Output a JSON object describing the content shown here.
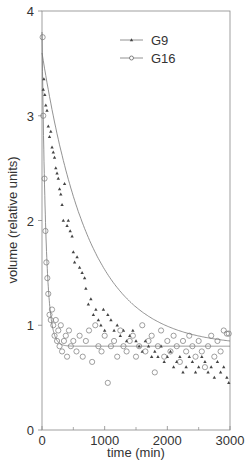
{
  "chart_data": {
    "type": "scatter",
    "title": "",
    "xlabel": "time (min)",
    "ylabel": "volume (relative units)",
    "xlim": [
      0,
      3000
    ],
    "ylim": [
      0,
      4
    ],
    "x_ticks": [
      0,
      1000,
      2000,
      3000
    ],
    "x_minor_ticks": [
      500,
      1500,
      2500
    ],
    "y_ticks": [
      0,
      1,
      2,
      3,
      4
    ],
    "grid": false,
    "legend_position": "upper right",
    "series": [
      {
        "name": "G9",
        "marker": "filled-triangle",
        "fit": {
          "model": "exponential_decay",
          "plateau": 0.8,
          "amplitude": 2.8,
          "tau_min": 745
        },
        "points": [
          [
            20,
            3.25
          ],
          [
            30,
            3.35
          ],
          [
            45,
            3.2
          ],
          [
            60,
            3.1
          ],
          [
            80,
            3.05
          ],
          [
            100,
            2.9
          ],
          [
            120,
            2.8
          ],
          [
            140,
            2.85
          ],
          [
            160,
            2.7
          ],
          [
            180,
            2.65
          ],
          [
            200,
            2.6
          ],
          [
            220,
            2.5
          ],
          [
            240,
            2.45
          ],
          [
            260,
            2.4
          ],
          [
            280,
            2.3
          ],
          [
            300,
            2.25
          ],
          [
            320,
            2.15
          ],
          [
            340,
            2.0
          ],
          [
            360,
            2.35
          ],
          [
            400,
            1.95
          ],
          [
            420,
            2.0
          ],
          [
            450,
            1.9
          ],
          [
            480,
            1.85
          ],
          [
            500,
            1.7
          ],
          [
            520,
            1.6
          ],
          [
            560,
            1.65
          ],
          [
            600,
            1.55
          ],
          [
            640,
            1.5
          ],
          [
            680,
            1.45
          ],
          [
            700,
            1.35
          ],
          [
            740,
            1.2
          ],
          [
            780,
            1.25
          ],
          [
            820,
            1.1
          ],
          [
            860,
            1.15
          ],
          [
            900,
            1.05
          ],
          [
            940,
            1.0
          ],
          [
            980,
            1.15
          ],
          [
            1000,
            0.95
          ],
          [
            1050,
            1.1
          ],
          [
            1100,
            1.05
          ],
          [
            1150,
            0.95
          ],
          [
            1200,
            1.0
          ],
          [
            1250,
            0.9
          ],
          [
            1300,
            0.95
          ],
          [
            1350,
            0.85
          ],
          [
            1400,
            0.9
          ],
          [
            1450,
            0.95
          ],
          [
            1500,
            0.85
          ],
          [
            1550,
            0.8
          ],
          [
            1600,
            0.75
          ],
          [
            1650,
            0.85
          ],
          [
            1700,
            0.8
          ],
          [
            1750,
            0.7
          ],
          [
            1800,
            0.75
          ],
          [
            1850,
            0.7
          ],
          [
            1900,
            0.8
          ],
          [
            1950,
            0.65
          ],
          [
            2000,
            0.7
          ],
          [
            2050,
            0.75
          ],
          [
            2100,
            0.6
          ],
          [
            2150,
            0.65
          ],
          [
            2200,
            0.7
          ],
          [
            2250,
            0.55
          ],
          [
            2300,
            0.6
          ],
          [
            2350,
            0.7
          ],
          [
            2400,
            0.65
          ],
          [
            2450,
            0.55
          ],
          [
            2500,
            0.6
          ],
          [
            2550,
            0.7
          ],
          [
            2600,
            0.65
          ],
          [
            2650,
            0.55
          ],
          [
            2700,
            0.6
          ],
          [
            2750,
            0.5
          ],
          [
            2800,
            0.65
          ],
          [
            2850,
            0.55
          ],
          [
            2900,
            0.6
          ],
          [
            2950,
            0.5
          ],
          [
            2980,
            0.45
          ]
        ]
      },
      {
        "name": "G16",
        "marker": "open-circle",
        "fit": {
          "model": "exponential_decay",
          "plateau": 0.8,
          "amplitude": 3.0,
          "tau_min": 60
        },
        "points": [
          [
            10,
            3.75
          ],
          [
            20,
            3.0
          ],
          [
            40,
            2.4
          ],
          [
            55,
            1.9
          ],
          [
            70,
            1.6
          ],
          [
            85,
            1.45
          ],
          [
            100,
            1.3
          ],
          [
            120,
            1.1
          ],
          [
            140,
            1.05
          ],
          [
            160,
            1.15
          ],
          [
            180,
            1.0
          ],
          [
            200,
            0.9
          ],
          [
            220,
            1.05
          ],
          [
            240,
            0.85
          ],
          [
            260,
            0.95
          ],
          [
            280,
            0.8
          ],
          [
            300,
            1.0
          ],
          [
            320,
            0.75
          ],
          [
            350,
            0.85
          ],
          [
            380,
            0.9
          ],
          [
            400,
            0.7
          ],
          [
            430,
            0.95
          ],
          [
            460,
            0.8
          ],
          [
            500,
            0.85
          ],
          [
            550,
            0.75
          ],
          [
            600,
            0.9
          ],
          [
            650,
            0.7
          ],
          [
            700,
            0.85
          ],
          [
            750,
            0.95
          ],
          [
            800,
            0.65
          ],
          [
            850,
            1.0
          ],
          [
            900,
            0.8
          ],
          [
            950,
            0.75
          ],
          [
            1000,
            0.9
          ],
          [
            1050,
            0.45
          ],
          [
            1100,
            0.8
          ],
          [
            1150,
            0.85
          ],
          [
            1200,
            0.7
          ],
          [
            1250,
            0.95
          ],
          [
            1300,
            0.8
          ],
          [
            1350,
            0.75
          ],
          [
            1400,
            0.85
          ],
          [
            1450,
            0.9
          ],
          [
            1500,
            0.7
          ],
          [
            1550,
            0.8
          ],
          [
            1600,
            1.0
          ],
          [
            1650,
            0.75
          ],
          [
            1700,
            0.85
          ],
          [
            1750,
            0.9
          ],
          [
            1800,
            0.55
          ],
          [
            1850,
            0.8
          ],
          [
            1900,
            0.95
          ],
          [
            1950,
            0.7
          ],
          [
            2000,
            0.85
          ],
          [
            2050,
            0.75
          ],
          [
            2100,
            0.9
          ],
          [
            2150,
            0.8
          ],
          [
            2200,
            0.65
          ],
          [
            2250,
            0.85
          ],
          [
            2300,
            0.75
          ],
          [
            2350,
            0.9
          ],
          [
            2400,
            0.8
          ],
          [
            2450,
            0.7
          ],
          [
            2500,
            0.85
          ],
          [
            2550,
            0.75
          ],
          [
            2600,
            0.6
          ],
          [
            2650,
            0.8
          ],
          [
            2700,
            0.9
          ],
          [
            2750,
            0.7
          ],
          [
            2800,
            0.85
          ],
          [
            2850,
            0.75
          ],
          [
            2900,
            0.95
          ],
          [
            2950,
            0.92
          ],
          [
            2980,
            0.92
          ]
        ]
      }
    ]
  },
  "legend": {
    "items": [
      {
        "label": "G9",
        "marker": "filled-triangle"
      },
      {
        "label": "G16",
        "marker": "open-circle"
      }
    ]
  },
  "colors": {
    "axis": "#888888",
    "line": "#777777",
    "marker": "#444444",
    "text": "#333333"
  }
}
